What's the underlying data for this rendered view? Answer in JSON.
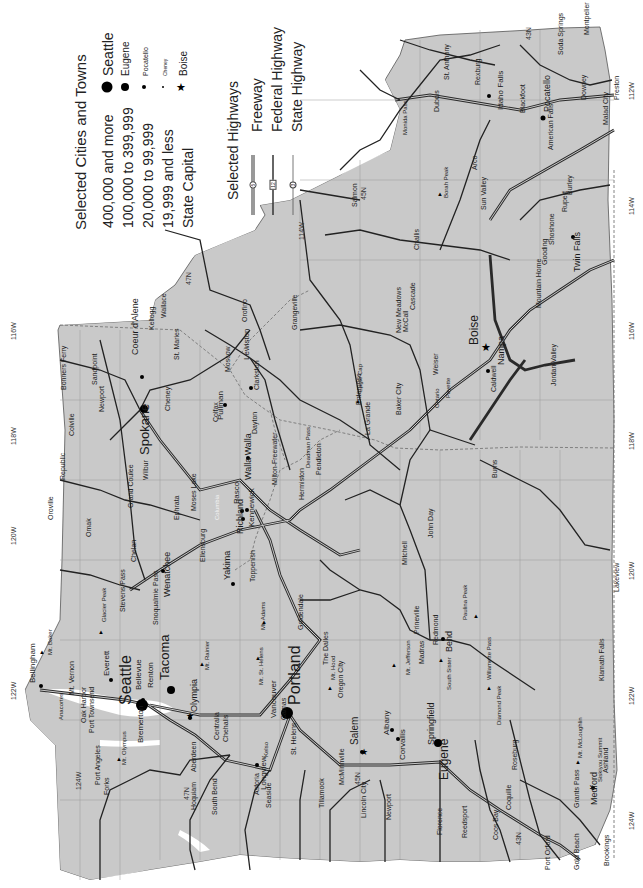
{
  "legend": {
    "cities_title": "Selected Cities and Towns",
    "city_classes": [
      {
        "range": "400,000 and more",
        "example": "Seattle",
        "symbol": "large-dot"
      },
      {
        "range": "100,000 to 399,999",
        "example": "Eugene",
        "symbol": "medium-dot"
      },
      {
        "range": "20,000 to 99,999",
        "example": "Pocatello",
        "symbol": "small-dot"
      },
      {
        "range": "19,999 and less",
        "example": "Cheney",
        "symbol": "tiny-dot"
      },
      {
        "range": "State Capital",
        "example": "Boise",
        "symbol": "star"
      }
    ],
    "highways_title": "Selected Highways",
    "highway_classes": [
      {
        "label": "Freeway",
        "shield": "5"
      },
      {
        "label": "Federal Highway",
        "shield": "12"
      },
      {
        "label": "State Highway",
        "shield": "3"
      }
    ]
  },
  "graticule": {
    "longitudes": [
      "124W",
      "122W",
      "120W",
      "118W",
      "116W",
      "114W",
      "112W"
    ],
    "latitudes": [
      "47N",
      "45N",
      "43N"
    ]
  },
  "cities": {
    "large": [
      "Seattle",
      "Portland"
    ],
    "medium": [
      "Spokane",
      "Tacoma",
      "Eugene",
      "Boise",
      "Salem"
    ],
    "small": [
      "Bellingham",
      "Everett",
      "Bellevue",
      "Renton",
      "Olympia",
      "Bremerton",
      "Vancouver",
      "Yakima",
      "Richland",
      "Kennewick",
      "Pasco",
      "Walla Walla",
      "Wenatchee",
      "Lewiston",
      "Pullman",
      "Coeur d'Alene",
      "Idaho Falls",
      "Pocatello",
      "Twin Falls",
      "Nampa",
      "Medford",
      "Bend",
      "Springfield",
      "Albany",
      "Corvallis",
      "Longview",
      "Caldwell",
      "Meridian"
    ],
    "towns": [
      "Mt. Vernon",
      "Anacortes",
      "Oak Harbor",
      "Port Townsend",
      "Port Angeles",
      "Forks",
      "Aberdeen",
      "Hoquiam",
      "South Bend",
      "Centralia",
      "Chehalis",
      "Kelso",
      "Astoria",
      "Seaside",
      "Tillamook",
      "St. Helens",
      "Camas",
      "Oregon City",
      "McMinnville",
      "Lincoln City",
      "Newport",
      "Florence",
      "Reedsport",
      "Coos Bay",
      "Coquille",
      "Port Orford",
      "Gold Beach",
      "Brookings",
      "Grants Pass",
      "Ashland",
      "Roseburg",
      "Klamath Falls",
      "Lakeview",
      "The Dalles",
      "Madras",
      "Prineville",
      "Redmond",
      "Goldendale",
      "Toppenish",
      "Ellensburg",
      "Moses Lake",
      "Ephrata",
      "Chelan",
      "Omak",
      "Oroville",
      "Republic",
      "Colville",
      "Newport",
      "Sandpoint",
      "Bonners Ferry",
      "Kellogg",
      "Wallace",
      "St. Maries",
      "Moscow",
      "Colfax",
      "Cheney",
      "Wilbur",
      "Grand Coulee",
      "Dayton",
      "Clarkston",
      "Orofino",
      "Grangeville",
      "Milton-Freewater",
      "Pendleton",
      "Hermiston",
      "La Grande",
      "Enterprise",
      "Baker City",
      "John Day",
      "Burns",
      "Mitchell",
      "Ontario",
      "Payette",
      "Weiser",
      "New Meadows",
      "McCall",
      "Cascade",
      "Mountain Home",
      "Jordan Valley",
      "Gooding",
      "Shoshone",
      "Rupert",
      "Burley",
      "American Falls",
      "Blackfoot",
      "Rexburg",
      "St. Anthony",
      "Dubois",
      "Arco",
      "Challis",
      "Salmon",
      "Sun Valley",
      "Soda Springs",
      "Montpelier",
      "Downey",
      "Malad City",
      "Preston"
    ],
    "peaks": [
      "Mt. Baker",
      "Glacier Peak",
      "Mt. Olympus",
      "Mt. Rainier",
      "Mt. Adams",
      "Mt. St. Helens",
      "Mt. Hood",
      "Mt. Jefferson",
      "South Sister",
      "Diamond Peak",
      "Mt. McLoughlin",
      "Paulina Peak",
      "Borah Peak",
      "Eagle Cap"
    ],
    "passes": [
      "Stevens Pass",
      "Snoqualmie Pass",
      "Deadman Pass",
      "Willamette Pass",
      "Siskiyou Summit",
      "Monida Pass"
    ]
  },
  "labels": {
    "Seattle": "Seattle",
    "Portland": "Portland",
    "Spokane": "Spokane",
    "Tacoma": "Tacoma",
    "Eugene": "Eugene",
    "Boise": "Boise",
    "Salem": "Salem",
    "Bellingham": "Bellingham",
    "Everett": "Everett",
    "Bellevue": "Bellevue",
    "Renton": "Renton",
    "Olympia": "Olympia",
    "Bremerton": "Bremerton",
    "Vancouver": "Vancouver",
    "Yakima": "Yakima",
    "Richland": "Richland",
    "Kennewick": "Kennewick",
    "Pasco": "Pasco",
    "WallaWalla": "Walla Walla",
    "Wenatchee": "Wenatchee",
    "Lewiston": "Lewiston",
    "Pullman": "Pullman",
    "Coeur": "Coeur d'Alene",
    "IdahoFalls": "Idaho Falls",
    "Pocatello": "Pocatello",
    "TwinFalls": "Twin Falls",
    "Nampa": "Nampa",
    "Medford": "Medford",
    "Bend": "Bend",
    "Springfield": "Springfield",
    "Albany": "Albany",
    "Corvallis": "Corvallis",
    "Longview": "Longview",
    "Caldwell": "Caldwell",
    "MtVernon": "Mt. Vernon",
    "Anacortes": "Anacortes",
    "OakHarbor": "Oak Harbor",
    "PortTownsend": "Port Townsend",
    "PortAngeles": "Port Angeles",
    "Forks": "Forks",
    "Aberdeen": "Aberdeen",
    "Hoquiam": "Hoquiam",
    "SouthBend": "South Bend",
    "Centralia": "Centralia",
    "Chehalis": "Chehalis",
    "Kelso": "Kelso",
    "Astoria": "Astoria",
    "Seaside": "Seaside",
    "Tillamook": "Tillamook",
    "StHelens": "St. Helens",
    "Camas": "Camas",
    "OregonCity": "Oregon City",
    "McMinnville": "McMinnville",
    "LincolnCity": "Lincoln City",
    "Newport": "Newport",
    "Florence": "Florence",
    "Reedsport": "Reedsport",
    "CoosBay": "Coos Bay",
    "Coquille": "Coquille",
    "PortOrford": "Port Orford",
    "GoldBeach": "Gold Beach",
    "Brookings": "Brookings",
    "GrantsPass": "Grants Pass",
    "Ashland": "Ashland",
    "Roseburg": "Roseburg",
    "KlamathFalls": "Klamath Falls",
    "Lakeview": "Lakeview",
    "TheDalles": "The Dalles",
    "Madras": "Madras",
    "Prineville": "Prineville",
    "Redmond": "Redmond",
    "Goldendale": "Goldendale",
    "Toppenish": "Toppenish",
    "Ellensburg": "Ellensburg",
    "MosesLake": "Moses Lake",
    "Ephrata": "Ephrata",
    "Chelan": "Chelan",
    "Omak": "Omak",
    "Oroville": "Oroville",
    "Republic": "Republic",
    "Colville": "Colville",
    "NewportWA": "Newport",
    "Sandpoint": "Sandpoint",
    "BonnersFerry": "Bonners Ferry",
    "Kellogg": "Kellogg",
    "Wallace": "Wallace",
    "StMaries": "St. Maries",
    "Moscow": "Moscow",
    "Colfax": "Colfax",
    "Cheney": "Cheney",
    "Wilbur": "Wilbur",
    "GrandCoulee": "Grand Coulee",
    "Dayton": "Dayton",
    "Clarkston": "Clarkston",
    "Orofino": "Orofino",
    "Grangeville": "Grangeville",
    "MiltonFreewater": "Milton-Freewater",
    "Pendleton": "Pendleton",
    "Hermiston": "Hermiston",
    "LaGrande": "La Grande",
    "Enterprise": "Enterprise",
    "BakerCity": "Baker  City",
    "JohnDay": "John Day",
    "Burns": "Burns",
    "Mitchell": "Mitchell",
    "Ontario": "Ontario",
    "Payette": "Payette",
    "Weiser": "Weiser",
    "NewMeadows": "New Meadows",
    "McCall": "McCall",
    "Cascade": "Cascade",
    "MountainHome": "Mountain Home",
    "JordanValley": "Jordan Valley",
    "Gooding": "Gooding",
    "Shoshone": "Shoshone",
    "Rupert": "Rupert",
    "Burley": "Burley",
    "AmericanFalls": "American Falls",
    "Blackfoot": "Blackfoot",
    "Rexburg": "Rexburg",
    "StAnthony": "St. Anthony",
    "Dubois": "Dubois",
    "Arco": "Arco",
    "Challis": "Challis",
    "Salmon": "Salmon",
    "SunValley": "Sun Valley",
    "SodaSprings": "Soda Springs",
    "Montpelier": "Montpelier",
    "Downey": "Downey",
    "MaladCity": "Malad City",
    "Preston": "Preston",
    "MtBaker": "Mt. Baker",
    "GlacierPeak": "Glacier Peak",
    "MtOlympus": "Mt. Olympus",
    "MtRainier": "Mt. Rainier",
    "MtAdams": "Mt. Adams",
    "MtStHelens": "Mt. St. Helens",
    "MtHood": "Mt. Hood",
    "MtJefferson": "Mt. Jefferson",
    "SouthSister": "South Sister",
    "DiamondPeak": "Diamond Peak",
    "MtMcLoughlin": "Mt. McLoughlin",
    "PaulinaPeak": "Paulina Peak",
    "BorahPeak": "Borah Peak",
    "EagleCap": "Eagle Cap",
    "StevensPass": "Stevens Pass",
    "SnoqualmiePass": "Snoqualmie Pass",
    "DeadmanPass": "Deadman Pass",
    "WillamettePass": "Willamette Pass",
    "SiskiyouSummit": "Siskiyou Summit",
    "MonidaPass": "Monida Pass",
    "Columbia": "Columbia"
  },
  "colors": {
    "land": "#c9c9c9",
    "water": "#ffffff",
    "road": "#2a2a2a",
    "border": "#8a8a8a",
    "text": "#1a1a1a"
  }
}
